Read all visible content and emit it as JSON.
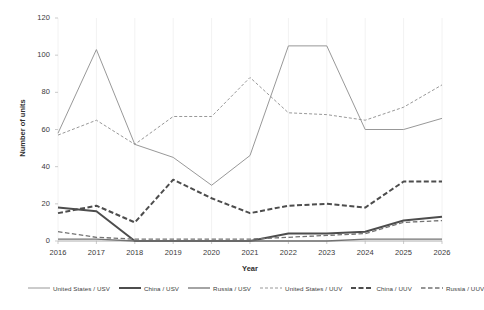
{
  "chart_data": {
    "type": "line",
    "title": "",
    "xlabel": "Year",
    "ylabel": "Number of units",
    "x": [
      2016,
      2017,
      2018,
      2019,
      2020,
      2021,
      2022,
      2023,
      2024,
      2025,
      2026
    ],
    "categories": [
      "2016",
      "2017",
      "2018",
      "2019",
      "2020",
      "2021",
      "2022",
      "2023",
      "2024",
      "2025",
      "2026"
    ],
    "xlim": [
      2016,
      2026
    ],
    "ylim": [
      0,
      120
    ],
    "yticks": [
      0,
      20,
      40,
      60,
      80,
      100,
      120
    ],
    "ytick_labels": [
      "0",
      "20",
      "40",
      "60",
      "80",
      "100",
      "120"
    ],
    "grid": false,
    "legend_position": "bottom",
    "series": [
      {
        "name": "United States / USV",
        "style": "solid",
        "width": 0.9,
        "color": "#8c8c8c",
        "values": [
          58,
          103,
          52,
          45,
          30,
          46,
          105,
          105,
          60,
          60,
          66
        ]
      },
      {
        "name": "China / USV",
        "style": "solid",
        "width": 2.0,
        "color": "#4d4d4d",
        "values": [
          18,
          16,
          0,
          0,
          0,
          0,
          4,
          4,
          5,
          11,
          13
        ]
      },
      {
        "name": "Russia / USV",
        "style": "solid",
        "width": 1.3,
        "color": "#737373",
        "values": [
          1,
          1,
          0,
          0,
          0,
          0,
          0,
          0,
          1,
          1,
          1
        ]
      },
      {
        "name": "United States / UUV",
        "style": "dashed",
        "width": 0.9,
        "color": "#8c8c8c",
        "values": [
          57,
          65,
          52,
          67,
          67,
          88,
          69,
          68,
          65,
          72,
          84
        ]
      },
      {
        "name": "China / UUV",
        "style": "dashed",
        "width": 2.0,
        "color": "#4d4d4d",
        "values": [
          15,
          19,
          10,
          33,
          23,
          15,
          19,
          20,
          18,
          32,
          32
        ]
      },
      {
        "name": "Russia / UUV",
        "style": "dashed",
        "width": 1.3,
        "color": "#737373",
        "values": [
          5,
          2,
          1,
          1,
          1,
          1,
          2,
          3,
          4,
          10,
          11
        ]
      }
    ]
  },
  "legend": {
    "items": [
      {
        "label": "United States / USV"
      },
      {
        "label": "China / USV"
      },
      {
        "label": "Russia / USV"
      },
      {
        "label": "United States / UUV"
      },
      {
        "label": "China / UUV"
      },
      {
        "label": "Russia / UUV"
      }
    ]
  }
}
